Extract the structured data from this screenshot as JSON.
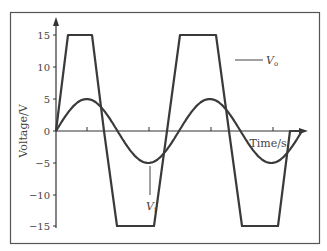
{
  "chart_data": {
    "type": "line",
    "title": "",
    "xlabel": "Time/s",
    "ylabel": "Voltage/V",
    "ylim": [
      -15,
      15
    ],
    "yticks": [
      15,
      10,
      5,
      0,
      -5,
      -10,
      -15
    ],
    "ytick_labels": [
      "15",
      "10",
      "5",
      "0",
      "−15",
      "−10",
      "−5"
    ],
    "x_ticks_unlabeled": 4,
    "grid": false,
    "legend": "inline annotations",
    "series": [
      {
        "name": "Vo",
        "label_main": "V",
        "label_sub": "o",
        "shape": "clipped sine (trapezoid), saturates at ±15 V",
        "amplitude": 15,
        "points": [
          [
            0,
            0
          ],
          [
            0.4,
            15
          ],
          [
            1.6,
            15
          ],
          [
            2.0,
            0
          ],
          [
            2.4,
            -15
          ],
          [
            3.6,
            -15
          ],
          [
            4.0,
            0
          ],
          [
            4.4,
            15
          ],
          [
            5.6,
            15
          ],
          [
            6.0,
            0
          ],
          [
            6.4,
            -15
          ],
          [
            7.6,
            -15
          ],
          [
            8.0,
            0
          ]
        ]
      },
      {
        "name": "Vi",
        "label_main": "V",
        "label_sub": "i",
        "shape": "sine",
        "amplitude": 5,
        "periods": 2
      }
    ],
    "annotations": [
      {
        "text": "Vo",
        "target": "upper clipped waveform",
        "position": "right of second positive plateau"
      },
      {
        "text": "Vi",
        "target": "sine wave",
        "position": "below first negative trough"
      }
    ]
  },
  "labels": {
    "ylabel": "Voltage/V",
    "xlabel": "Time/s",
    "vo_main": "V",
    "vo_sub": "o",
    "vi_main": "V",
    "vi_sub": "i",
    "y15": "15",
    "y10": "10",
    "y5": "5",
    "y0": "0",
    "ym5": "−5",
    "ym10": "−10",
    "ym15": "−15"
  },
  "colors": {
    "curve": "#3a3a3a",
    "axis": "#333333",
    "frame": "#555555",
    "text": "#444444"
  }
}
